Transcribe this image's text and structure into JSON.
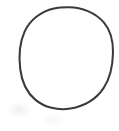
{
  "canvas": {
    "width": 119,
    "height": 131,
    "background_color": "#ffffff",
    "description": "Blank white scanned page area containing a single hand-drawn circle outline"
  },
  "figure": {
    "name": "circle-outline",
    "shape_type": "circle",
    "label": "Circle",
    "stroke_color": "#3a3a3a",
    "stroke_width_px": 2,
    "fill_color": "none",
    "center_x": 68,
    "center_y": 58,
    "radius_x": 45,
    "radius_y": 51,
    "bounds": {
      "left": 23,
      "top": 7,
      "right": 113,
      "bottom": 109
    },
    "appearance": "hand-drawn, slightly irregular, soft antialiased scanned edges"
  },
  "artifacts": {
    "smudge_primary": {
      "name": "scan-smudge",
      "color": "#e2e2e4",
      "x": 6,
      "y": 101,
      "width": 26,
      "height": 17
    },
    "smudge_secondary": {
      "name": "scan-smudge-faint",
      "color": "#ededef",
      "x": 44,
      "y": 114,
      "width": 20,
      "height": 12
    }
  },
  "text": {
    "visible_text": "",
    "has_labels": "false"
  }
}
